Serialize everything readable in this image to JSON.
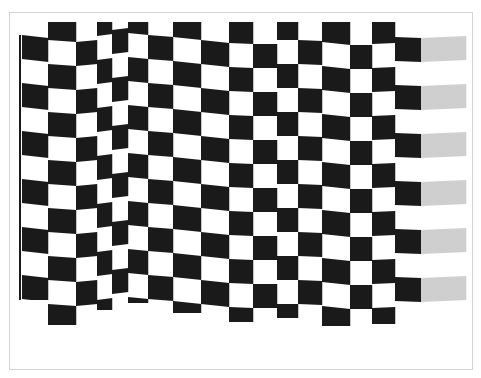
{
  "image": {
    "subject": "waving checkered racing flag",
    "frame_border_color": "#d4d4d4",
    "colors": {
      "black": "#1a1a1a",
      "white": "#ffffff",
      "gray": "#cfcfcf",
      "pole": "#1a1a1a"
    }
  },
  "flag": {
    "row_height": 24,
    "clip_top": 22,
    "columns": [
      {
        "x0": 22,
        "x1": 48,
        "yl": 11,
        "yr": 14,
        "first": "white",
        "bottom": 300
      },
      {
        "x0": 48,
        "x1": 76,
        "yl": 16,
        "yr": 18,
        "first": "black",
        "bottom": 325
      },
      {
        "x0": 76,
        "x1": 97,
        "yl": 18,
        "yr": 16,
        "first": "white",
        "bottom": 324
      },
      {
        "x0": 97,
        "x1": 112,
        "yl": 12,
        "yr": 10,
        "first": "black",
        "bottom": 310
      },
      {
        "x0": 112,
        "x1": 128,
        "yl": 6,
        "yr": 4,
        "first": "white",
        "bottom": 300
      },
      {
        "x0": 128,
        "x1": 148,
        "yl": 9,
        "yr": 11,
        "first": "black",
        "bottom": 303
      },
      {
        "x0": 148,
        "x1": 173,
        "yl": 11,
        "yr": 13,
        "first": "white",
        "bottom": 308
      },
      {
        "x0": 173,
        "x1": 201,
        "yl": 13,
        "yr": 16,
        "first": "black",
        "bottom": 313
      },
      {
        "x0": 201,
        "x1": 229,
        "yl": 16,
        "yr": 19,
        "first": "white",
        "bottom": 318
      },
      {
        "x0": 229,
        "x1": 253,
        "yl": 19,
        "yr": 20,
        "first": "black",
        "bottom": 322
      },
      {
        "x0": 253,
        "x1": 277,
        "yl": 20,
        "yr": 20,
        "first": "white",
        "bottom": 322
      },
      {
        "x0": 277,
        "x1": 298,
        "yl": 16,
        "yr": 16,
        "first": "black",
        "bottom": 318
      },
      {
        "x0": 298,
        "x1": 322,
        "yl": 16,
        "yr": 17,
        "first": "white",
        "bottom": 318
      },
      {
        "x0": 322,
        "x1": 350,
        "yl": 18,
        "yr": 21,
        "first": "black",
        "bottom": 326
      },
      {
        "x0": 350,
        "x1": 372,
        "yl": 21,
        "yr": 21,
        "first": "white",
        "bottom": 326
      },
      {
        "x0": 372,
        "x1": 395,
        "yl": 20,
        "yr": 19,
        "first": "black",
        "bottom": 324
      },
      {
        "x0": 395,
        "x1": 421,
        "yl": 13,
        "yr": 14,
        "first": "white",
        "bottom": 303
      },
      {
        "x0": 421,
        "x1": 466,
        "yl": 14,
        "yr": 12,
        "first": "white",
        "bottom": 303,
        "gray": true
      }
    ],
    "pole": {
      "x": 19,
      "width": 2,
      "top": 35,
      "bottom": 300
    }
  }
}
